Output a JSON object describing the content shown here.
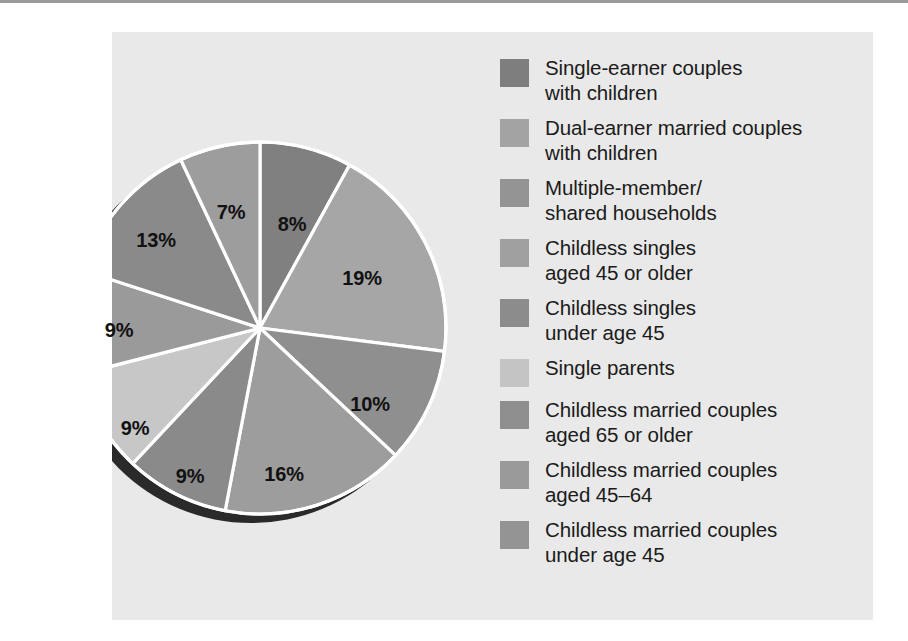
{
  "chart_data": {
    "type": "pie",
    "title": "",
    "subtitle": "",
    "xlabel": "",
    "ylabel": "",
    "legend_position": "right",
    "grid": false,
    "value_suffix": "%",
    "start_angle_deg": 0,
    "direction": "clockwise",
    "categories": [
      "Single-earner couples with children",
      "Dual-earner married couples with children",
      "Multiple-member/ shared households",
      "Childless singles aged 45 or older",
      "Childless singles under age 45",
      "Single parents",
      "Childless married couples aged 65 or older",
      "Childless married couples aged 45–64",
      "Childless married couples under age 45"
    ],
    "values": [
      8,
      19,
      10,
      16,
      9,
      9,
      9,
      13,
      7
    ],
    "labels": [
      "8%",
      "19%",
      "10%",
      "16%",
      "9%",
      "9%",
      "9%",
      "13%",
      "7%"
    ],
    "colors": [
      "#808080",
      "#a6a6a6",
      "#8f8f8f",
      "#9d9d9d",
      "#8a8a8a",
      "#c7c7c7",
      "#9a9a9a",
      "#8a8a8a",
      "#9d9d9d"
    ]
  },
  "figure": {
    "background": "#e9e9e9",
    "page_background": "#ffffff",
    "separator_color": "#9a9a9a",
    "slice_divider_color": "#ffffff",
    "shadow_color": "#2a2a2a",
    "label_color": "#111111"
  },
  "pie": {
    "center_x": 148,
    "center_y": 296,
    "radius": 186,
    "slices": [
      {
        "label": "8%",
        "value": 8,
        "color": "#808080",
        "label_x": 180,
        "label_y": 192
      },
      {
        "label": "19%",
        "value": 19,
        "color": "#a6a6a6",
        "label_x": 250,
        "label_y": 246
      },
      {
        "label": "10%",
        "value": 10,
        "color": "#8f8f8f",
        "label_x": 258,
        "label_y": 372
      },
      {
        "label": "16%",
        "value": 16,
        "color": "#9d9d9d",
        "label_x": 172,
        "label_y": 442
      },
      {
        "label": "9%",
        "value": 9,
        "color": "#8a8a8a",
        "label_x": 78,
        "label_y": 444
      },
      {
        "label": "9%",
        "value": 9,
        "color": "#c7c7c7",
        "label_x": 23,
        "label_y": 396
      },
      {
        "label": "9%",
        "value": 9,
        "color": "#9a9a9a",
        "label_x": 7,
        "label_y": 298
      },
      {
        "label": "13%",
        "value": 13,
        "color": "#8a8a8a",
        "label_x": 44,
        "label_y": 208
      },
      {
        "label": "7%",
        "value": 7,
        "color": "#9d9d9d",
        "label_x": 119,
        "label_y": 180
      }
    ]
  },
  "legend": {
    "items": [
      {
        "label": "Single-earner couples\nwith children",
        "color": "#7e7e7e"
      },
      {
        "label": "Dual-earner married couples\nwith children",
        "color": "#a3a3a3"
      },
      {
        "label": "Multiple-member/\nshared households",
        "color": "#949494"
      },
      {
        "label": "Childless singles\naged 45 or older",
        "color": "#a0a0a0"
      },
      {
        "label": "Childless singles\nunder age 45",
        "color": "#8c8c8c"
      },
      {
        "label": "Single parents",
        "color": "#c4c4c4"
      },
      {
        "label": "Childless married couples\naged 65 or older",
        "color": "#8f8f8f"
      },
      {
        "label": "Childless married couples\naged 45–64",
        "color": "#9a9a9a"
      },
      {
        "label": "Childless married couples\nunder age 45",
        "color": "#949494"
      }
    ]
  }
}
